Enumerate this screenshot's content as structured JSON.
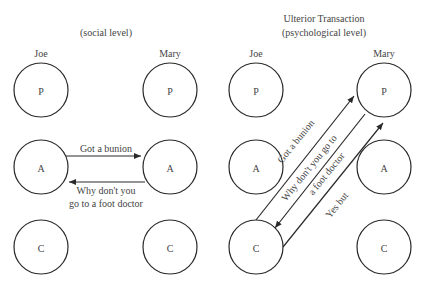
{
  "left_panel": {
    "title": "(social level)",
    "persons": [
      {
        "name": "Joe",
        "states": [
          "P",
          "A",
          "C"
        ]
      },
      {
        "name": "Mary",
        "states": [
          "P",
          "A",
          "C"
        ]
      }
    ],
    "transactions": [
      {
        "from": "Joe.A",
        "to": "Mary.A",
        "label": "Got a bunion"
      },
      {
        "from": "Mary.A",
        "to": "Joe.A",
        "label_line1": "Why don't you",
        "label_line2": "go to a foot doctor"
      }
    ]
  },
  "right_panel": {
    "title_line1": "Ulterior Transaction",
    "title_line2": "(psychological level)",
    "persons": [
      {
        "name": "Joe",
        "states": [
          "P",
          "A",
          "C"
        ]
      },
      {
        "name": "Mary",
        "states": [
          "P",
          "A",
          "C"
        ]
      }
    ],
    "transactions": [
      {
        "from": "Joe.C",
        "to": "Mary.P",
        "label": "Got a bunion"
      },
      {
        "from": "Mary.P",
        "to": "Joe.C",
        "label_line1": "Why don't you go to",
        "label_line2": "a foot doctor"
      },
      {
        "from": "Joe.C",
        "to": "Mary.P",
        "label": "Yes but"
      }
    ]
  },
  "colors": {
    "stroke": "#2a2a2a",
    "text": "#444444",
    "background": "#ffffff"
  }
}
